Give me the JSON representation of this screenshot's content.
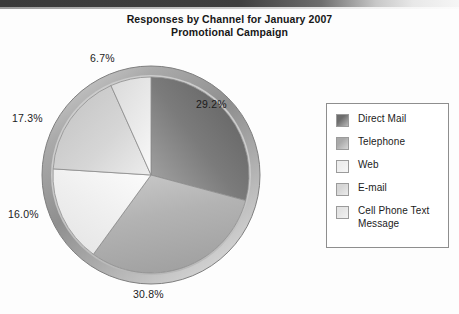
{
  "chart_data": {
    "type": "pie",
    "title": "Responses by Channel for January 2007 Promotional Campaign",
    "title_line1": "Responses by Channel for January 2007",
    "title_line2": "Promotional Campaign",
    "xlabel": "",
    "ylabel": "",
    "legend_position": "right",
    "grid": false,
    "unit": "percent",
    "categories": [
      "Direct Mail",
      "Telephone",
      "Web",
      "E-mail",
      "Cell Phone Text Message"
    ],
    "values": [
      29.2,
      30.8,
      16.0,
      17.3,
      6.7
    ],
    "labels": [
      "29.2%",
      "30.8%",
      "16.0%",
      "17.3%",
      "6.7%"
    ],
    "colors": [
      "#6d6d6d",
      "#a9a9a9",
      "#ededed",
      "#d2d2d2",
      "#e2e2e2"
    ],
    "slices": [
      {
        "name": "Direct Mail",
        "value": 29.2,
        "label": "29.2%",
        "color": "#6d6d6d",
        "color_light": "#9a9a9a"
      },
      {
        "name": "Telephone",
        "value": 30.8,
        "label": "30.8%",
        "color": "#a9a9a9",
        "color_light": "#c9c9c9"
      },
      {
        "name": "Web",
        "value": 16.0,
        "label": "16.0%",
        "color": "#ededed",
        "color_light": "#fbfbfb"
      },
      {
        "name": "E-mail",
        "value": 17.3,
        "label": "17.3%",
        "color": "#d2d2d2",
        "color_light": "#eaeaea"
      },
      {
        "name": "Cell Phone Text Message",
        "value": 6.7,
        "label": "6.7%",
        "color": "#e2e2e2",
        "color_light": "#f4f4f4"
      }
    ]
  },
  "legend": {
    "items": [
      {
        "label": "Direct Mail",
        "color": "#6d6d6d"
      },
      {
        "label": "Telephone",
        "color": "#a9a9a9"
      },
      {
        "label": "Web",
        "color": "#ededed"
      },
      {
        "label": "E-mail",
        "color": "#d6d6d6"
      },
      {
        "label": "Cell Phone Text Message",
        "color": "#e4e4e4"
      }
    ]
  },
  "percent_labels": {
    "top": "6.7%",
    "right": "29.2%",
    "upper_left": "17.3%",
    "lower_left": "16.0%",
    "bottom": "30.8%"
  },
  "theme": {
    "text_color": "#1b1b1b",
    "border_color": "#8e8e8e",
    "background": "#fdfdfd",
    "bezel_outer": "#8a8a8a",
    "bezel_inner": "#d8d8d8"
  }
}
